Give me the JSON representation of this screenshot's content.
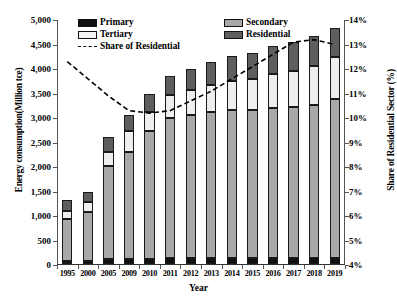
{
  "chart_data": {
    "type": "bar",
    "subtype": "stacked-bar-with-line",
    "title": "",
    "xlabel": "Year",
    "ylabel": "Energy consumption(Million tce)",
    "y2label": "Share of Residential Sector (%)",
    "categories": [
      "1995",
      "2000",
      "2005",
      "2009",
      "2010",
      "2011",
      "2012",
      "2013",
      "2014",
      "2015",
      "2016",
      "2017",
      "2018",
      "2019"
    ],
    "ylim": [
      0,
      5000
    ],
    "yticks": [
      "0",
      "500",
      "1,000",
      "1,500",
      "2,000",
      "2,500",
      "3,000",
      "3,500",
      "4,000",
      "4,500",
      "5,000"
    ],
    "y2lim": [
      4,
      14
    ],
    "y2ticks": [
      "4%",
      "5%",
      "6%",
      "7%",
      "8%",
      "9%",
      "10%",
      "11%",
      "12%",
      "13%",
      "14%"
    ],
    "grid": false,
    "legend_position": "top-left",
    "series": [
      {
        "name": "Primary",
        "axis": "left",
        "color": "#101010",
        "values": [
          60,
          70,
          95,
          105,
          110,
          115,
          118,
          120,
          122,
          120,
          122,
          125,
          128,
          130
        ]
      },
      {
        "name": "Secondary",
        "axis": "left",
        "color": "#a8a8a8",
        "values": [
          860,
          1000,
          1900,
          2180,
          2600,
          2870,
          2930,
          2990,
          3030,
          3020,
          3060,
          3080,
          3120,
          3240
        ]
      },
      {
        "name": "Tertiary",
        "axis": "left",
        "color": "#eeeeee",
        "values": [
          160,
          200,
          300,
          420,
          390,
          460,
          500,
          540,
          580,
          630,
          690,
          740,
          800,
          860
        ]
      },
      {
        "name": "Residential",
        "axis": "left",
        "color": "#5e5e5e",
        "values": [
          220,
          200,
          305,
          345,
          380,
          395,
          432,
          470,
          518,
          540,
          568,
          595,
          602,
          580
        ]
      },
      {
        "name": "Share of Residential",
        "axis": "right",
        "style": "dashed-line",
        "color": "#000000",
        "values": [
          12.3,
          11.6,
          10.9,
          10.3,
          10.2,
          10.3,
          10.7,
          11.1,
          11.6,
          12.1,
          12.6,
          13.1,
          13.2,
          13.0
        ]
      }
    ],
    "legend": [
      {
        "label": "Primary",
        "type": "swatch",
        "color": "#101010"
      },
      {
        "label": "Secondary",
        "type": "swatch",
        "color": "#a8a8a8"
      },
      {
        "label": "Tertiary",
        "type": "swatch",
        "color": "#f4f4f4"
      },
      {
        "label": "Residential",
        "type": "swatch",
        "color": "#5e5e5e"
      },
      {
        "label": "Share of Residential",
        "type": "dashed-line",
        "color": "#000000"
      }
    ]
  }
}
